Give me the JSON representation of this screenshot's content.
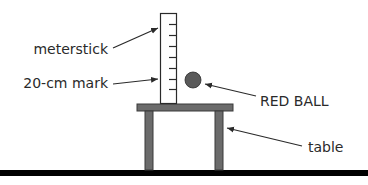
{
  "labels": {
    "meterstick": "meterstick",
    "mark": "20-cm mark",
    "ball": "RED BALL",
    "table": "table"
  },
  "colors": {
    "ink": "#2a2a2a",
    "table": "#6b6b6b",
    "ball": "#5a5a5a",
    "floor": "#000000",
    "stick_fill": "#ffffff"
  }
}
